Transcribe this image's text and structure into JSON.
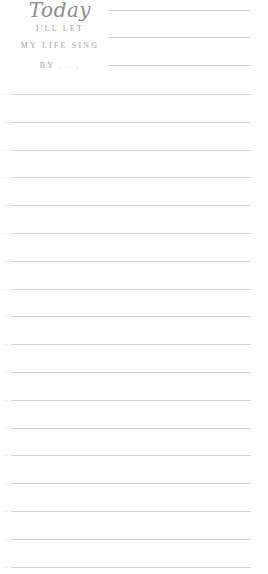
{
  "header": {
    "title": "Today",
    "line1": "I'LL LET",
    "line2": "MY LIFE SING",
    "line3": "BY . . .",
    "text_color": "#9a9a9a"
  },
  "header_lines": [
    10,
    37,
    65
  ],
  "ruled_lines": {
    "count": 18,
    "start_y": 94,
    "spacing": 27.8,
    "color": "#d4d4d4"
  }
}
